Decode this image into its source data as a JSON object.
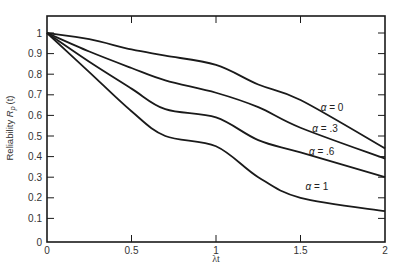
{
  "chart_data": {
    "type": "line",
    "title": "",
    "xlabel": "λt",
    "ylabel": "Reliability R_p(t)",
    "xlim": [
      0,
      2
    ],
    "ylim": [
      0,
      1.0
    ],
    "grid": false,
    "legend_position": "inline labels near right end of curves",
    "x_ticks": [
      "0",
      "0.5",
      "1",
      "1.5",
      "2"
    ],
    "y_ticks": [
      "0",
      "0.1",
      "0.2",
      "0.3",
      "0.4",
      "0.5",
      "0.6",
      "0.7",
      "0.8",
      "0.9",
      "1"
    ],
    "x": [
      0,
      0.25,
      0.5,
      0.7,
      1.0,
      1.25,
      1.5,
      2.0
    ],
    "series": [
      {
        "name": "α = 0",
        "values": [
          1.0,
          0.97,
          0.92,
          0.89,
          0.845,
          0.75,
          0.675,
          0.44
        ]
      },
      {
        "name": "α = .3",
        "values": [
          1.0,
          0.91,
          0.83,
          0.77,
          0.71,
          0.64,
          0.54,
          0.39
        ]
      },
      {
        "name": "α = .6",
        "values": [
          1.0,
          0.86,
          0.73,
          0.63,
          0.59,
          0.48,
          0.42,
          0.3
        ]
      },
      {
        "name": "α = 1",
        "values": [
          1.0,
          0.81,
          0.62,
          0.5,
          0.45,
          0.3,
          0.2,
          0.135
        ]
      }
    ],
    "annotations": [
      {
        "text": "α = 0",
        "x": 1.62,
        "y": 0.62
      },
      {
        "text": "α = .3",
        "x": 1.57,
        "y": 0.52
      },
      {
        "text": "α = .6",
        "x": 1.55,
        "y": 0.41
      },
      {
        "text": "α = 1",
        "x": 1.53,
        "y": 0.24
      }
    ]
  },
  "labels": {
    "xlabel": "λt",
    "ylabel_main": "Reliability ",
    "ylabel_symbol": "R",
    "ylabel_sub": "p",
    "ylabel_arg": "(t)"
  }
}
